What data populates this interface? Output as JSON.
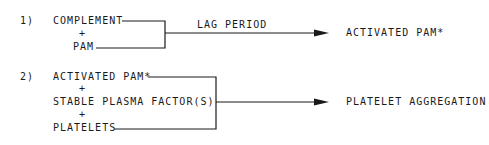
{
  "reactions": [
    {
      "number": "1)",
      "inputs": [
        "COMPLEMENT",
        "PAM"
      ],
      "operator": "+",
      "arrow_label": "LAG PERIOD",
      "product": "ACTIVATED PAM*"
    },
    {
      "number": "2)",
      "inputs": [
        "ACTIVATED PAM*",
        "STABLE PLASMA FACTOR(S)",
        "PLATELETS"
      ],
      "operator": "+",
      "product": "PLATELET AGGREGATION"
    }
  ],
  "colors": {
    "ink": "#1a1a1a",
    "background": "#ffffff"
  }
}
